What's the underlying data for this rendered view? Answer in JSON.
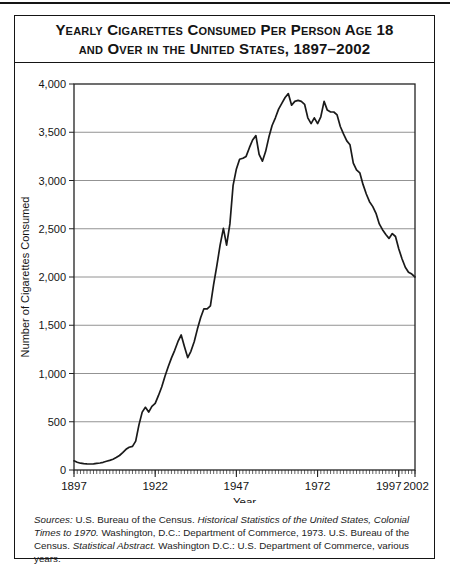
{
  "figure": {
    "title_line1": "Yearly Cigarettes Consumed Per Person Age 18",
    "title_line2": "and Over in the United States, 1897–2002",
    "sources_segments": [
      {
        "text": "Sources:",
        "italic": true
      },
      {
        "text": " U.S. Bureau of the Census. ",
        "italic": false
      },
      {
        "text": "Historical Statistics of the United States, Colonial Times to 1970.",
        "italic": true
      },
      {
        "text": " Washington, D.C.: Department of Commerce, 1973.  U.S. Bureau of the Census. ",
        "italic": false
      },
      {
        "text": "Statistical Abstract.",
        "italic": true
      },
      {
        "text": " Washington D.C.: U.S. Department of Commerce, various years.",
        "italic": false
      }
    ]
  },
  "chart_data": {
    "type": "line",
    "title": "Yearly Cigarettes Consumed Per Person Age 18 and Over in the United States, 1897–2002",
    "xlabel": "Year",
    "ylabel": "Number of Cigarettes Consumed",
    "xlim": [
      1897,
      2002
    ],
    "ylim": [
      0,
      4000
    ],
    "grid": "horizontal",
    "legend": "none",
    "line_color": "#1a1a1a",
    "grid_color": "#777777",
    "axis_color": "#222222",
    "y_ticks": [
      0,
      500,
      1000,
      1500,
      2000,
      2500,
      3000,
      3500,
      4000
    ],
    "y_tick_labels": [
      "0",
      "500",
      "1,000",
      "1,500",
      "2,000",
      "2,500",
      "3,000",
      "3,500",
      "4,000"
    ],
    "x_tick_years": [
      1897,
      1922,
      1947,
      1972,
      1997,
      2002
    ],
    "x_tick_labels": [
      "1897",
      "1922",
      "1947",
      "1972",
      "1997",
      "2002"
    ],
    "minor_x_ticks_every_year": true,
    "series": [
      {
        "name": "Cigarettes consumed per person age 18 and over",
        "x": [
          1897,
          1898,
          1899,
          1900,
          1901,
          1902,
          1903,
          1904,
          1905,
          1906,
          1907,
          1908,
          1909,
          1910,
          1911,
          1912,
          1913,
          1914,
          1915,
          1916,
          1917,
          1918,
          1919,
          1920,
          1921,
          1922,
          1923,
          1924,
          1925,
          1926,
          1927,
          1928,
          1929,
          1930,
          1931,
          1932,
          1933,
          1934,
          1935,
          1936,
          1937,
          1938,
          1939,
          1940,
          1941,
          1942,
          1943,
          1944,
          1945,
          1946,
          1947,
          1948,
          1949,
          1950,
          1951,
          1952,
          1953,
          1954,
          1955,
          1956,
          1957,
          1958,
          1959,
          1960,
          1961,
          1962,
          1963,
          1964,
          1965,
          1966,
          1967,
          1968,
          1969,
          1970,
          1971,
          1972,
          1973,
          1974,
          1975,
          1976,
          1977,
          1978,
          1979,
          1980,
          1981,
          1982,
          1983,
          1984,
          1985,
          1986,
          1987,
          1988,
          1989,
          1990,
          1991,
          1992,
          1993,
          1994,
          1995,
          1996,
          1997,
          1998,
          1999,
          2000,
          2001,
          2002
        ],
        "y": [
          95,
          80,
          70,
          65,
          63,
          62,
          64,
          68,
          73,
          80,
          90,
          100,
          112,
          130,
          150,
          180,
          215,
          235,
          245,
          300,
          470,
          600,
          650,
          600,
          660,
          690,
          770,
          860,
          970,
          1070,
          1160,
          1240,
          1330,
          1400,
          1280,
          1165,
          1230,
          1330,
          1460,
          1580,
          1670,
          1670,
          1700,
          1920,
          2120,
          2330,
          2505,
          2330,
          2550,
          2950,
          3120,
          3220,
          3230,
          3250,
          3340,
          3420,
          3465,
          3270,
          3200,
          3300,
          3450,
          3570,
          3650,
          3740,
          3800,
          3860,
          3900,
          3780,
          3820,
          3830,
          3820,
          3790,
          3650,
          3590,
          3650,
          3590,
          3660,
          3820,
          3730,
          3710,
          3710,
          3680,
          3560,
          3480,
          3410,
          3370,
          3180,
          3110,
          3080,
          2960,
          2860,
          2780,
          2730,
          2660,
          2550,
          2490,
          2440,
          2400,
          2450,
          2420,
          2290,
          2190,
          2100,
          2050,
          2030,
          2000
        ]
      }
    ]
  }
}
